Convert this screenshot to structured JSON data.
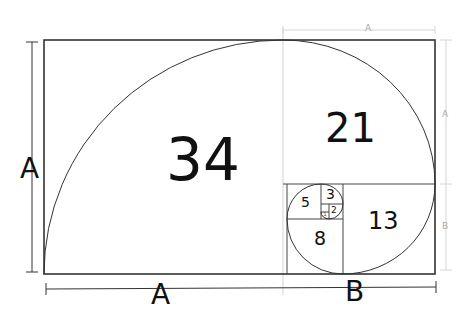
{
  "diagram": {
    "squares": [
      {
        "id": "sq34",
        "label": "34"
      },
      {
        "id": "sq21",
        "label": "21"
      },
      {
        "id": "sq13",
        "label": "13"
      },
      {
        "id": "sq8",
        "label": "8"
      },
      {
        "id": "sq5",
        "label": "5"
      },
      {
        "id": "sq3",
        "label": "3"
      },
      {
        "id": "sq2",
        "label": "2"
      },
      {
        "id": "sq1",
        "label": "1"
      }
    ],
    "dimensions": {
      "left": "A",
      "bottom_a": "A",
      "bottom_b": "B",
      "top": "A",
      "right_a": "A",
      "right_b": "B"
    },
    "colors": {
      "line": "#333333",
      "guide": "#cccccc",
      "text": "#111111",
      "light_text": "#aaaaaa"
    }
  }
}
